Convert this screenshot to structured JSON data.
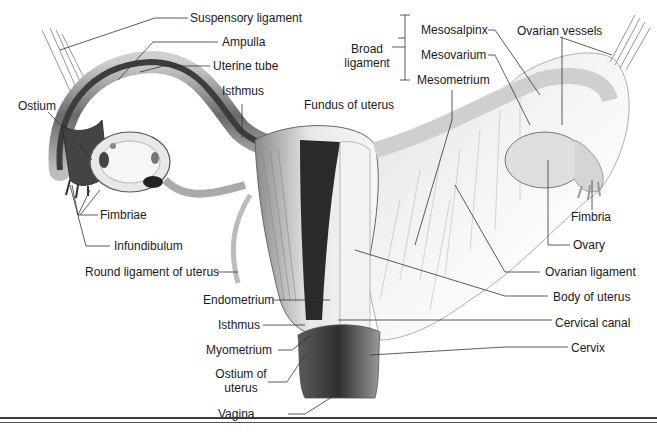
{
  "diagram": {
    "labels": {
      "suspensory_ligament": "Suspensory ligament",
      "ampulla": "Ampulla",
      "uterine_tube": "Uterine tube",
      "isthmus_tube": "Isthmus",
      "ostium": "Ostium",
      "fimbriae": "Fimbriae",
      "infundibulum": "Infundibulum",
      "round_ligament": "Round ligament of uterus",
      "fundus": "Fundus of uterus",
      "broad_ligament_1": "Broad",
      "broad_ligament_2": "ligament",
      "mesosalpinx": "Mesosalpinx",
      "mesovarium": "Mesovarium",
      "mesometrium": "Mesometrium",
      "ovarian_vessels": "Ovarian vessels",
      "fimbria": "Fimbria",
      "ovary": "Ovary",
      "ovarian_ligament": "Ovarian ligament",
      "body_of_uterus": "Body of uterus",
      "endometrium": "Endometrium",
      "isthmus_uterus": "Isthmus",
      "cervical_canal": "Cervical canal",
      "myometrium": "Myometrium",
      "ostium_uterus_1": "Ostium of",
      "ostium_uterus_2": "uterus",
      "cervix": "Cervix",
      "vagina": "Vagina"
    },
    "colors": {
      "line": "#333333",
      "tissue_light": "#e6e6e6",
      "tissue_mid": "#b5b5b5",
      "tissue_dark": "#3c3c3c"
    }
  }
}
